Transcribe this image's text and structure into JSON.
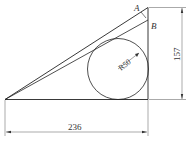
{
  "diagram": {
    "type": "geometry-drawing",
    "labels": {
      "point_a": "A",
      "point_b": "B",
      "radius": "R50",
      "height_dim": "157",
      "width_dim": "236"
    },
    "colors": {
      "line": "#222222",
      "dim_line": "#444444",
      "background": "#ffffff"
    }
  }
}
